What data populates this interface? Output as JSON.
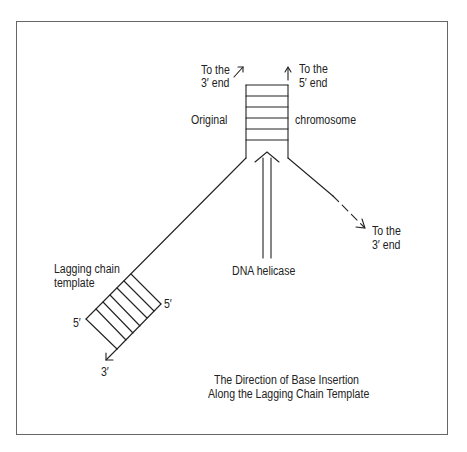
{
  "labels": {
    "top_left_line1": "To the",
    "top_left_line2": "3′ end",
    "top_right_line1": "To the",
    "top_right_line2": "5′ end",
    "original": "Original",
    "chromosome": "chromosome",
    "right_line1": "To the",
    "right_line2": "3′ end",
    "helicase": "DNA helicase",
    "lagging_line1": "Lagging chain",
    "lagging_line2": "template",
    "five_prime_left": "5′",
    "five_prime_right": "5′",
    "three_prime_bottom": "3′",
    "caption_line1": "The Direction of Base Insertion",
    "caption_line2": "Along the Lagging Chain Template"
  },
  "colors": {
    "stroke": "#222222",
    "frame": "#666666",
    "background": "#ffffff"
  }
}
